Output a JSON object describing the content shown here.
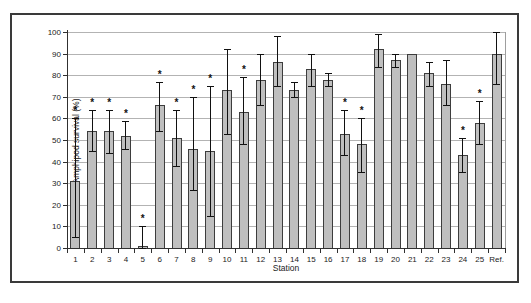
{
  "figure": {
    "background": "#ffffff",
    "border_color": "#3a3a3a"
  },
  "chart_data": {
    "type": "bar",
    "title": "",
    "xlabel": "Station",
    "ylabel": "Amphipod survival (%)",
    "ylim": [
      0,
      100
    ],
    "ytick_step": 10,
    "yticks": [
      "0",
      "10",
      "20",
      "30",
      "40",
      "50",
      "60",
      "70",
      "80",
      "90",
      "100"
    ],
    "grid": "horizontal",
    "legend": "none",
    "significance_marker": "*",
    "bar_fill": "#bfbfbf",
    "bar_border": "#3d3d3d",
    "gridline_color": "#b3b3b3",
    "categories": [
      "1",
      "2",
      "3",
      "4",
      "5",
      "6",
      "7",
      "8",
      "9",
      "10",
      "11",
      "12",
      "13",
      "14",
      "15",
      "16",
      "17",
      "18",
      "19",
      "20",
      "21",
      "22",
      "23",
      "24",
      "25",
      "Ref."
    ],
    "values": [
      31,
      54,
      54,
      52,
      1,
      66,
      51,
      46,
      45,
      73,
      63,
      78,
      86,
      73,
      83,
      78,
      53,
      48,
      92,
      87,
      90,
      81,
      76,
      43,
      58,
      90
    ],
    "error_low": [
      5,
      45,
      44,
      46,
      0,
      54,
      38,
      27,
      15,
      53,
      48,
      66,
      75,
      70,
      75,
      75,
      43,
      35,
      84,
      84,
      null,
      75,
      66,
      35,
      48,
      76
    ],
    "error_high": [
      60,
      64,
      64,
      59,
      10,
      77,
      64,
      70,
      75,
      92,
      79,
      90,
      98,
      77,
      90,
      81,
      64,
      60,
      99,
      90,
      null,
      86,
      87,
      51,
      68,
      100
    ],
    "significant": [
      true,
      true,
      true,
      true,
      true,
      true,
      true,
      true,
      true,
      false,
      true,
      false,
      false,
      false,
      false,
      false,
      true,
      true,
      false,
      false,
      false,
      false,
      false,
      true,
      true,
      false
    ]
  }
}
